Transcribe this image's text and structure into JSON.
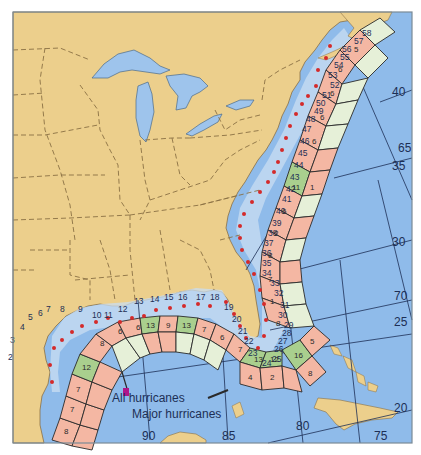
{
  "map": {
    "colors": {
      "land": "#eccf8c",
      "ocean": "#8fbbea",
      "nearshore": "#c9def2",
      "lake": "#9ec4ec",
      "border": "#8a7044",
      "high_cell": "#f4b7a3",
      "medium_cell": "#a9cf8e",
      "low_cell": "#e6f0d8",
      "dot": "#d42a2a",
      "grid_line": "#1d2f55"
    },
    "legend": {
      "all_label": "All hurricanes",
      "major_label": "Major hurricanes"
    },
    "longitude_labels": [
      "90",
      "85",
      "80",
      "75",
      "70",
      "65"
    ],
    "latitude_labels": [
      "20",
      "25",
      "30",
      "35",
      "40"
    ]
  },
  "coastal_segments": {
    "gulf_upper": [
      "1",
      "2",
      "3",
      "4",
      "5",
      "6",
      "7",
      "8",
      "9",
      "10",
      "11",
      "12",
      "13",
      "14",
      "15",
      "16",
      "17",
      "18",
      "19",
      "20",
      "21",
      "22",
      "23",
      "24",
      "25",
      "26",
      "27",
      "28",
      "29",
      "30",
      "31",
      "32",
      "33",
      "34",
      "35",
      "36",
      "37",
      "38",
      "39",
      "40",
      "41",
      "42",
      "43",
      "44",
      "45",
      "46",
      "47",
      "48",
      "49",
      "50",
      "51",
      "52",
      "53",
      "54",
      "55",
      "56",
      "57",
      "58"
    ]
  },
  "all_hurricanes_cells": {
    "gulf": [
      "8",
      "7",
      "7",
      "8",
      "6",
      "12",
      "12",
      "8",
      "6",
      "8",
      "9",
      "13",
      "9",
      "6",
      "13",
      "14",
      "7",
      "6",
      "7",
      "6",
      "6",
      "6",
      "4",
      "5",
      "9",
      "13",
      "12",
      "16",
      "16",
      "15",
      "5",
      "8",
      "2",
      "1",
      "1",
      "2",
      "7",
      "8",
      "6",
      "5",
      "6",
      "6",
      "5",
      "11",
      "6",
      "2",
      "2",
      "1",
      "1",
      "2",
      "6",
      "6",
      "7",
      "6",
      "1",
      "4",
      "6",
      "5"
    ],
    "atlantic_major": [
      "2",
      "4",
      "1",
      "2",
      "1",
      "2",
      "5",
      "5",
      "7",
      "7",
      "5",
      "1",
      "1",
      "1",
      "2",
      "2",
      "2",
      "2",
      "4",
      "1",
      "1",
      "2",
      "1",
      "1",
      "1",
      "1",
      "1",
      "1",
      "1"
    ]
  }
}
